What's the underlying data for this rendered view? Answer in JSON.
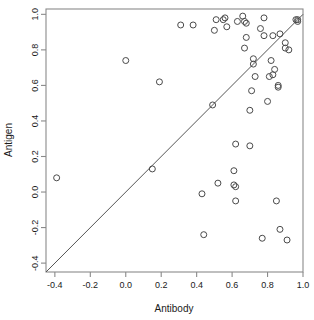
{
  "chart_data": {
    "type": "scatter",
    "title": "",
    "xlabel": "Antibody",
    "ylabel": "Antigen",
    "xlim": [
      -0.45,
      1.0
    ],
    "ylim": [
      -0.45,
      1.03
    ],
    "grid": false,
    "legend": null,
    "xticks": [
      -0.4,
      -0.2,
      0.0,
      0.2,
      0.4,
      0.6,
      0.8,
      1.0
    ],
    "xticklabels": [
      "-0.4",
      "-0.2",
      "0.0",
      "0.2",
      "0.4",
      "0.6",
      "0.8",
      "1.0"
    ],
    "yticks": [
      -0.4,
      -0.2,
      0.0,
      0.2,
      0.4,
      0.6,
      0.8,
      1.0
    ],
    "yticklabels": [
      "-0.4",
      "-0.2",
      "0.0",
      "0.2",
      "0.4",
      "0.6",
      "0.8",
      "1.0"
    ],
    "annotations": [
      {
        "type": "line",
        "name": "identity-line",
        "description": "y = x reference line",
        "slope": 1,
        "intercept": 0
      }
    ],
    "marker": {
      "shape": "circle",
      "filled": false,
      "radius_px": 3,
      "color": "#4a4a4a"
    },
    "points": [
      {
        "x": -0.39,
        "y": 0.08
      },
      {
        "x": 0.0,
        "y": 0.74
      },
      {
        "x": 0.15,
        "y": 0.13
      },
      {
        "x": 0.19,
        "y": 0.62
      },
      {
        "x": 0.31,
        "y": 0.94
      },
      {
        "x": 0.38,
        "y": 0.94
      },
      {
        "x": 0.43,
        "y": -0.01
      },
      {
        "x": 0.44,
        "y": -0.24
      },
      {
        "x": 0.49,
        "y": 0.49
      },
      {
        "x": 0.5,
        "y": 0.91
      },
      {
        "x": 0.51,
        "y": 0.97
      },
      {
        "x": 0.52,
        "y": 0.05
      },
      {
        "x": 0.55,
        "y": 0.97
      },
      {
        "x": 0.56,
        "y": 0.98
      },
      {
        "x": 0.57,
        "y": 0.93
      },
      {
        "x": 0.61,
        "y": 0.12
      },
      {
        "x": 0.61,
        "y": 0.04
      },
      {
        "x": 0.62,
        "y": 0.27
      },
      {
        "x": 0.62,
        "y": 0.03
      },
      {
        "x": 0.62,
        "y": -0.05
      },
      {
        "x": 0.63,
        "y": 0.96
      },
      {
        "x": 0.66,
        "y": 0.99
      },
      {
        "x": 0.67,
        "y": 0.96
      },
      {
        "x": 0.67,
        "y": 0.81
      },
      {
        "x": 0.68,
        "y": 0.87
      },
      {
        "x": 0.68,
        "y": 0.95
      },
      {
        "x": 0.7,
        "y": 0.26
      },
      {
        "x": 0.7,
        "y": 0.46
      },
      {
        "x": 0.71,
        "y": 0.57
      },
      {
        "x": 0.72,
        "y": 0.72
      },
      {
        "x": 0.72,
        "y": 0.75
      },
      {
        "x": 0.73,
        "y": 0.65
      },
      {
        "x": 0.76,
        "y": 0.92
      },
      {
        "x": 0.77,
        "y": -0.26
      },
      {
        "x": 0.78,
        "y": 0.98
      },
      {
        "x": 0.78,
        "y": 0.88
      },
      {
        "x": 0.8,
        "y": 0.51
      },
      {
        "x": 0.81,
        "y": 0.65
      },
      {
        "x": 0.82,
        "y": 0.74
      },
      {
        "x": 0.83,
        "y": 0.66
      },
      {
        "x": 0.83,
        "y": 0.88
      },
      {
        "x": 0.84,
        "y": 0.69
      },
      {
        "x": 0.85,
        "y": -0.05
      },
      {
        "x": 0.86,
        "y": 0.59
      },
      {
        "x": 0.86,
        "y": 0.6
      },
      {
        "x": 0.87,
        "y": 0.89
      },
      {
        "x": 0.87,
        "y": -0.21
      },
      {
        "x": 0.9,
        "y": 0.84
      },
      {
        "x": 0.9,
        "y": 0.81
      },
      {
        "x": 0.91,
        "y": -0.27
      },
      {
        "x": 0.92,
        "y": 0.8
      },
      {
        "x": 0.96,
        "y": 0.97
      },
      {
        "x": 0.97,
        "y": 0.97
      },
      {
        "x": 0.97,
        "y": 0.96
      }
    ]
  }
}
